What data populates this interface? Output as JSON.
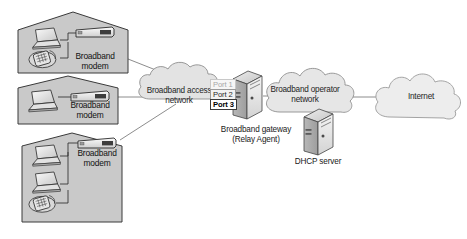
{
  "diagram": {
    "background_color": "#ffffff",
    "house_fill": "#c9c9c9",
    "house_stroke": "#3a3a3a",
    "cloud_fill": "#e8e8e8",
    "cloud_stroke": "#8a8a8a",
    "line_color": "#6f6f6f"
  },
  "houses": [
    {
      "id": "house-top",
      "modem_label_line1": "Broadband",
      "modem_label_line2": "modem",
      "devices": [
        "laptop",
        "telephone"
      ]
    },
    {
      "id": "house-middle",
      "modem_label_line1": "Broadband",
      "modem_label_line2": "modem",
      "devices": [
        "laptop"
      ]
    },
    {
      "id": "house-bottom",
      "modem_label_line1": "Broadband",
      "modem_label_line2": "modem",
      "devices": [
        "laptop",
        "laptop",
        "telephone"
      ]
    }
  ],
  "clouds": [
    {
      "id": "cloud-access",
      "line1": "Broadband access",
      "line2": "network"
    },
    {
      "id": "cloud-operator",
      "line1": "Broadband operator",
      "line2": "network"
    },
    {
      "id": "cloud-internet",
      "line1": "Internet",
      "line2": ""
    }
  ],
  "ports": [
    {
      "label": "Port 1",
      "state": "faded"
    },
    {
      "label": "Port 2",
      "state": "normal"
    },
    {
      "label": "Port 3",
      "state": "strong"
    }
  ],
  "gateway": {
    "label_line1": "Broadband gateway",
    "label_line2": "(Relay Agent)",
    "icon": "server-tower-icon"
  },
  "dhcp_server": {
    "label": "DHCP server",
    "icon": "server-tower-icon"
  }
}
